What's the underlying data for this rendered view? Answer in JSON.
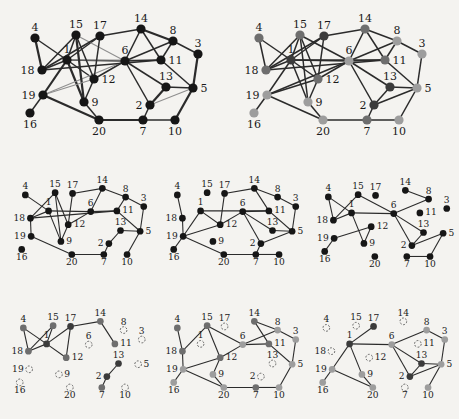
{
  "page": {
    "background": "#f4f3f0"
  },
  "figure": {
    "description_labels": [],
    "node_ids": [
      1,
      2,
      3,
      4,
      5,
      6,
      7,
      8,
      9,
      10,
      11,
      12,
      13,
      14,
      15,
      16,
      17,
      18,
      19,
      20
    ],
    "positions": {
      "1": [
        51,
        48
      ],
      "2": [
        134,
        93
      ],
      "3": [
        182,
        42
      ],
      "4": [
        19,
        26
      ],
      "5": [
        177,
        76
      ],
      "6": [
        109,
        49
      ],
      "7": [
        127,
        108
      ],
      "8": [
        157,
        29
      ],
      "9": [
        68,
        90
      ],
      "10": [
        159,
        108
      ],
      "11": [
        145,
        48
      ],
      "12": [
        78,
        67
      ],
      "13": [
        150,
        75
      ],
      "14": [
        125,
        17
      ],
      "15": [
        60,
        23
      ],
      "16": [
        14,
        101
      ],
      "17": [
        84,
        24
      ],
      "18": [
        26,
        58
      ],
      "19": [
        27,
        83
      ],
      "20": [
        83,
        108
      ]
    },
    "label_side": {
      "1": "top",
      "2": "left",
      "3": "top",
      "4": "top",
      "5": "right",
      "6": "top",
      "7": "bottom",
      "8": "top",
      "9": "right",
      "10": "bottom",
      "11": "right",
      "12": "right",
      "13": "top",
      "14": "top",
      "15": "top",
      "16": "bottom",
      "17": "top",
      "18": "left",
      "19": "left",
      "20": "bottom"
    },
    "communities": {
      "dark": [
        1,
        2,
        13,
        17
      ],
      "medium": [
        4,
        7,
        11,
        12,
        14,
        15,
        18
      ],
      "light": [
        3,
        5,
        6,
        8,
        9,
        10,
        16,
        19,
        20
      ]
    },
    "colors": {
      "plain": "#161616",
      "dark": "#3b3b3b",
      "medium": "#6e6e6e",
      "light": "#9d9d9d",
      "edge": "#2b2b2b",
      "edge_light": "#8f8f8f",
      "dashed_outline": "#5a5a5a",
      "label": "#1a1a1a"
    },
    "edges_full": [
      [
        1,
        4
      ],
      [
        1,
        6
      ],
      [
        1,
        9
      ],
      [
        1,
        11
      ],
      [
        1,
        12
      ],
      [
        1,
        15
      ],
      [
        1,
        17
      ],
      [
        1,
        18
      ],
      [
        1,
        19
      ],
      [
        2,
        5
      ],
      [
        2,
        6
      ],
      [
        2,
        7
      ],
      [
        2,
        13
      ],
      [
        3,
        5
      ],
      [
        3,
        8
      ],
      [
        4,
        18
      ],
      [
        5,
        10
      ],
      [
        5,
        11
      ],
      [
        5,
        13
      ],
      [
        6,
        8
      ],
      [
        6,
        11
      ],
      [
        6,
        12
      ],
      [
        6,
        13
      ],
      [
        6,
        14
      ],
      [
        6,
        15
      ],
      [
        6,
        19
      ],
      [
        7,
        10
      ],
      [
        7,
        20
      ],
      [
        8,
        11
      ],
      [
        8,
        14
      ],
      [
        9,
        12
      ],
      [
        9,
        15
      ],
      [
        9,
        20
      ],
      [
        11,
        14
      ],
      [
        11,
        18
      ],
      [
        12,
        15
      ],
      [
        12,
        17
      ],
      [
        12,
        19
      ],
      [
        14,
        17
      ],
      [
        15,
        18
      ],
      [
        16,
        19
      ],
      [
        17,
        18
      ],
      [
        19,
        20
      ]
    ],
    "panels": [
      {
        "name": "original-graph",
        "x": 16,
        "y": 12,
        "scale": 1,
        "style": "plain",
        "edges": "full",
        "dashed": [],
        "light_edges": [
          [
            6,
            15
          ],
          [
            6,
            19
          ],
          [
            12,
            19
          ],
          [
            2,
            5
          ],
          [
            1,
            11
          ]
        ],
        "bold_edges": [
          [
            1,
            9
          ],
          [
            1,
            19
          ],
          [
            4,
            18
          ],
          [
            9,
            15
          ],
          [
            19,
            20
          ],
          [
            2,
            13
          ],
          [
            3,
            5
          ],
          [
            5,
            10
          ],
          [
            8,
            14
          ],
          [
            7,
            20
          ]
        ]
      },
      {
        "name": "community-colored-graph",
        "x": 240,
        "y": 12,
        "scale": 1,
        "style": "community",
        "edges": "full",
        "dashed": []
      },
      {
        "name": "subgraph-sample-1",
        "x": 11,
        "y": 176,
        "scale": 0.73,
        "style": "plain",
        "edges": [
          [
            1,
            4
          ],
          [
            15,
            18
          ],
          [
            12,
            15
          ],
          [
            9,
            15
          ],
          [
            1,
            18
          ],
          [
            1,
            9
          ],
          [
            1,
            6
          ],
          [
            12,
            17
          ],
          [
            14,
            17
          ],
          [
            11,
            18
          ],
          [
            18,
            19
          ],
          [
            19,
            20
          ],
          [
            9,
            12
          ],
          [
            6,
            11
          ],
          [
            6,
            12
          ],
          [
            6,
            14
          ],
          [
            8,
            14
          ],
          [
            8,
            11
          ],
          [
            3,
            8
          ],
          [
            3,
            5
          ],
          [
            5,
            11
          ],
          [
            5,
            13
          ],
          [
            2,
            13
          ],
          [
            2,
            7
          ],
          [
            7,
            20
          ],
          [
            5,
            10
          ]
        ],
        "dashed": []
      },
      {
        "name": "subgraph-sample-2",
        "x": 163,
        "y": 176,
        "scale": 0.73,
        "style": "plain",
        "edges": [
          [
            4,
            18
          ],
          [
            18,
            19
          ],
          [
            1,
            19
          ],
          [
            12,
            19
          ],
          [
            16,
            19
          ],
          [
            19,
            20
          ],
          [
            1,
            11
          ],
          [
            1,
            12
          ],
          [
            12,
            17
          ],
          [
            14,
            17
          ],
          [
            11,
            14
          ],
          [
            8,
            14
          ],
          [
            3,
            8
          ],
          [
            3,
            5
          ],
          [
            6,
            11
          ],
          [
            5,
            11
          ],
          [
            6,
            12
          ],
          [
            2,
            6
          ],
          [
            6,
            13
          ],
          [
            5,
            13
          ],
          [
            2,
            7
          ],
          [
            2,
            5
          ],
          [
            7,
            20
          ],
          [
            7,
            10
          ]
        ],
        "dashed": []
      },
      {
        "name": "subgraph-sample-3",
        "x": 314,
        "y": 178,
        "scale": 0.73,
        "style": "plain",
        "edges": [
          [
            4,
            18
          ],
          [
            1,
            4
          ],
          [
            15,
            18
          ],
          [
            6,
            15
          ],
          [
            1,
            18
          ],
          [
            1,
            9
          ],
          [
            1,
            6
          ],
          [
            6,
            8
          ],
          [
            2,
            6
          ],
          [
            6,
            13
          ],
          [
            8,
            14
          ],
          [
            2,
            13
          ],
          [
            2,
            5
          ],
          [
            5,
            10
          ],
          [
            7,
            10
          ],
          [
            12,
            19
          ],
          [
            16,
            19
          ],
          [
            9,
            12
          ]
        ],
        "dashed": []
      },
      {
        "name": "cluster-subset-dark-medium",
        "x": 9,
        "y": 309,
        "scale": 0.73,
        "style": "community",
        "edges": [
          [
            4,
            18
          ],
          [
            1,
            4
          ],
          [
            15,
            18
          ],
          [
            1,
            15
          ],
          [
            1,
            17
          ],
          [
            1,
            12
          ],
          [
            1,
            18
          ],
          [
            12,
            17
          ],
          [
            14,
            17
          ],
          [
            11,
            14
          ],
          [
            2,
            13
          ],
          [
            2,
            7
          ]
        ],
        "dashed": [
          3,
          5,
          6,
          8,
          9,
          10,
          16,
          19,
          20
        ]
      },
      {
        "name": "cluster-subset-medium-light",
        "x": 163,
        "y": 309,
        "scale": 0.73,
        "style": "community",
        "edges": [
          [
            4,
            18
          ],
          [
            15,
            18
          ],
          [
            12,
            15
          ],
          [
            6,
            15
          ],
          [
            18,
            19
          ],
          [
            16,
            19
          ],
          [
            12,
            19
          ],
          [
            19,
            20
          ],
          [
            6,
            12
          ],
          [
            9,
            12
          ],
          [
            6,
            11
          ],
          [
            8,
            14
          ],
          [
            11,
            14
          ],
          [
            6,
            8
          ],
          [
            3,
            8
          ],
          [
            3,
            5
          ],
          [
            5,
            11
          ],
          [
            5,
            10
          ],
          [
            7,
            10
          ],
          [
            7,
            20
          ],
          [
            9,
            20
          ]
        ],
        "dashed": [
          1,
          2,
          13,
          17
        ]
      },
      {
        "name": "cluster-subset-dark-light",
        "x": 312,
        "y": 309,
        "scale": 0.73,
        "style": "community",
        "edges": [
          [
            1,
            17
          ],
          [
            1,
            6
          ],
          [
            1,
            19
          ],
          [
            1,
            9
          ],
          [
            16,
            19
          ],
          [
            19,
            20
          ],
          [
            9,
            20
          ],
          [
            6,
            8
          ],
          [
            6,
            13
          ],
          [
            2,
            6
          ],
          [
            3,
            8
          ],
          [
            3,
            5
          ],
          [
            5,
            13
          ],
          [
            2,
            13
          ],
          [
            2,
            5
          ],
          [
            5,
            10
          ]
        ],
        "dashed": [
          4,
          7,
          11,
          12,
          14,
          15,
          18
        ]
      }
    ]
  }
}
